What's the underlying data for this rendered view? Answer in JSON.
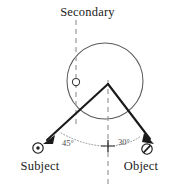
{
  "figure": {
    "title": "Secondary",
    "labels": {
      "secondary": "Secondary",
      "subject": "Subject",
      "object": "Object"
    },
    "angles": {
      "left": "45°",
      "right": "30°"
    },
    "colors": {
      "stroke": "#1a1a1a",
      "circle": "#5a5a5a",
      "dashed": "#9a9a9a",
      "dotted": "#8a8a8a",
      "background": "#ffffff"
    },
    "icons": {
      "subject_marker": "circled-dot-icon",
      "object_marker": "circled-slash-icon",
      "secondary_marker": "small-circle-icon",
      "origin_marker": "cross-tick-icon"
    },
    "geometry": {
      "circle_center_x": 105,
      "circle_center_y": 81,
      "circle_radius": 38,
      "apex_x": 108,
      "apex_y": 83,
      "origin_x": 108,
      "origin_y": 146
    }
  }
}
